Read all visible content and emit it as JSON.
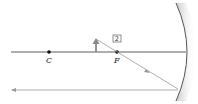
{
  "diagram": {
    "type": "concave-mirror-ray-diagram",
    "labels": {
      "center_of_curvature": "C",
      "focal_point": "F",
      "ray_number": "2"
    },
    "colors": {
      "axis": "#333333",
      "ray": "#999999",
      "object_arrow": "#8a8a8a",
      "mirror_edge": "#555555",
      "mirror_shade": "#d0d0d0"
    }
  }
}
